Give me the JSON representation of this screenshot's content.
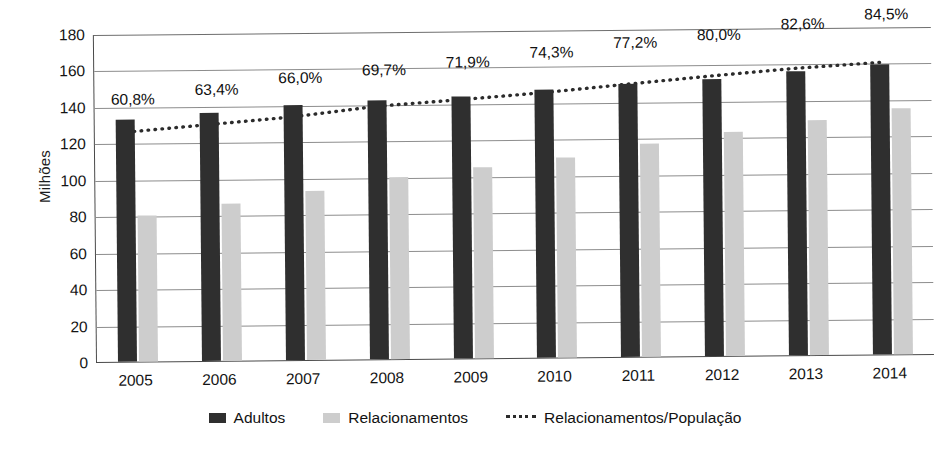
{
  "chart_data": {
    "type": "bar",
    "title": "",
    "xlabel": "",
    "ylabel": "Milhões",
    "ylim": [
      0,
      180
    ],
    "ytick_step": 20,
    "yticks": [
      "180",
      "160",
      "140",
      "120",
      "100",
      "80",
      "60",
      "40",
      "20",
      "0"
    ],
    "grid": true,
    "legend_position": "bottom",
    "categories": [
      "2005",
      "2006",
      "2007",
      "2008",
      "2009",
      "2010",
      "2011",
      "2012",
      "2013",
      "2014"
    ],
    "series": [
      {
        "name": "Adultos",
        "kind": "bar",
        "color": "#2f2f2f",
        "values": [
          133,
          136,
          140,
          142,
          144,
          147,
          150,
          152,
          156,
          159
        ]
      },
      {
        "name": "Relacionamentos",
        "kind": "bar",
        "color": "#cdcdcd",
        "values": [
          80,
          86,
          93,
          100,
          105,
          110,
          117,
          123,
          129,
          135
        ]
      },
      {
        "name": "Relacionamentos/População",
        "kind": "line-dotted",
        "color": "#2b2b2b",
        "axis": "percent",
        "values": [
          60.8,
          63.4,
          66.0,
          69.7,
          71.9,
          74.3,
          77.2,
          80.0,
          82.6,
          84.5
        ],
        "data_labels": [
          "60,8%",
          "63,4%",
          "66,0%",
          "69,7%",
          "71,9%",
          "74,3%",
          "77,2%",
          "80,0%",
          "82,6%",
          "84,5%"
        ]
      }
    ]
  },
  "legend": {
    "items": [
      {
        "label": "Adultos",
        "marker": "dark-square-swatch"
      },
      {
        "label": "Relacionamentos",
        "marker": "light-square-swatch"
      },
      {
        "label": "Relacionamentos/População",
        "marker": "dotted-line-swatch"
      }
    ]
  }
}
